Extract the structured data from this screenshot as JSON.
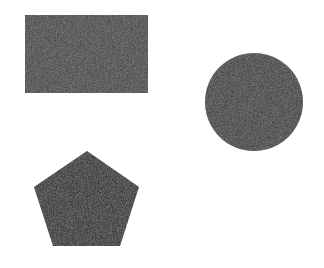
{
  "canvas": {
    "width": 324,
    "height": 268,
    "background": "#ffffff"
  },
  "shapes": [
    {
      "type": "rectangle",
      "label": "rectangle",
      "x": 25,
      "y": 15,
      "width": 123,
      "height": 78,
      "fill": "#3a3a3a"
    },
    {
      "type": "circle",
      "label": "circle",
      "cx": 254,
      "cy": 102,
      "r": 49,
      "fill": "#333333"
    },
    {
      "type": "pentagon",
      "label": "pentagon",
      "points": "87,151 139,187 120,246 53,246 34,187",
      "fill": "#141414"
    }
  ]
}
